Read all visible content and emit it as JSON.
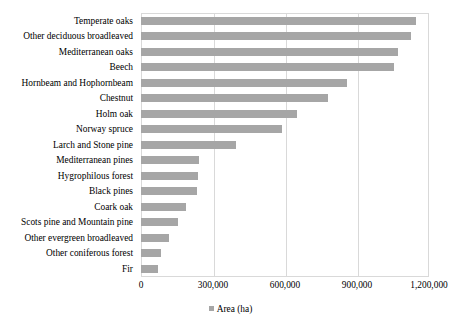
{
  "chart_data": {
    "type": "bar",
    "orientation": "horizontal",
    "title": "",
    "xlabel": "",
    "ylabel": "",
    "xlim": [
      0,
      1200000
    ],
    "xticks": [
      "0",
      "300,000",
      "600,000",
      "900,000",
      "1,200,000"
    ],
    "xtick_values": [
      0,
      300000,
      600000,
      900000,
      1200000
    ],
    "grid": "vertical",
    "legend": {
      "position": "bottom-center",
      "entries": [
        {
          "label": "Area (ha)",
          "color": "#a6a6a6"
        }
      ]
    },
    "series_name": "Area (ha)",
    "bar_color": "#a6a6a6",
    "categories": [
      "Temperate oaks",
      "Other deciduous broadleaved",
      "Mediterranean oaks",
      "Beech",
      "Hornbeam and Hophornbeam",
      "Chestnut",
      "Holm oak",
      "Norway spruce",
      "Larch and Stone pine",
      "Mediterranean pines",
      "Hygrophilous forest",
      "Black pines",
      "Coark oak",
      "Scots pine and Mountain pine",
      "Other evergreen broadleaved",
      "Other coniferous forest",
      "Fir"
    ],
    "values": [
      1145000,
      1125000,
      1070000,
      1055000,
      860000,
      780000,
      650000,
      588000,
      395000,
      242000,
      238000,
      233000,
      188000,
      154000,
      117000,
      83000,
      71000
    ]
  }
}
